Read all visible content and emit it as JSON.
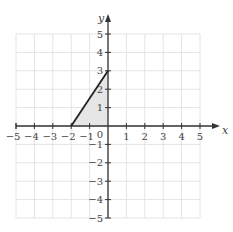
{
  "chart_data": {
    "type": "line",
    "title": "",
    "xlabel": "x",
    "ylabel": "y",
    "xlim": [
      -5,
      5
    ],
    "ylim": [
      -5,
      5
    ],
    "grid": true,
    "x_ticks": [
      -5,
      -4,
      -3,
      -2,
      -1,
      1,
      2,
      3,
      4,
      5
    ],
    "y_ticks": [
      5,
      4,
      3,
      2,
      1,
      -1,
      -2,
      -3,
      -4,
      -5
    ],
    "origin_label": "0",
    "series": [
      {
        "name": "line",
        "points": [
          [
            -2,
            0
          ],
          [
            0,
            3
          ]
        ]
      }
    ],
    "shaded_region": {
      "vertices": [
        [
          -2,
          0
        ],
        [
          0,
          3
        ],
        [
          0,
          0
        ]
      ],
      "fill": "#e6e6e6"
    }
  },
  "colors": {
    "grid": "#e4e4e4",
    "axis": "#333333",
    "line": "#222222",
    "label": "#444444"
  }
}
